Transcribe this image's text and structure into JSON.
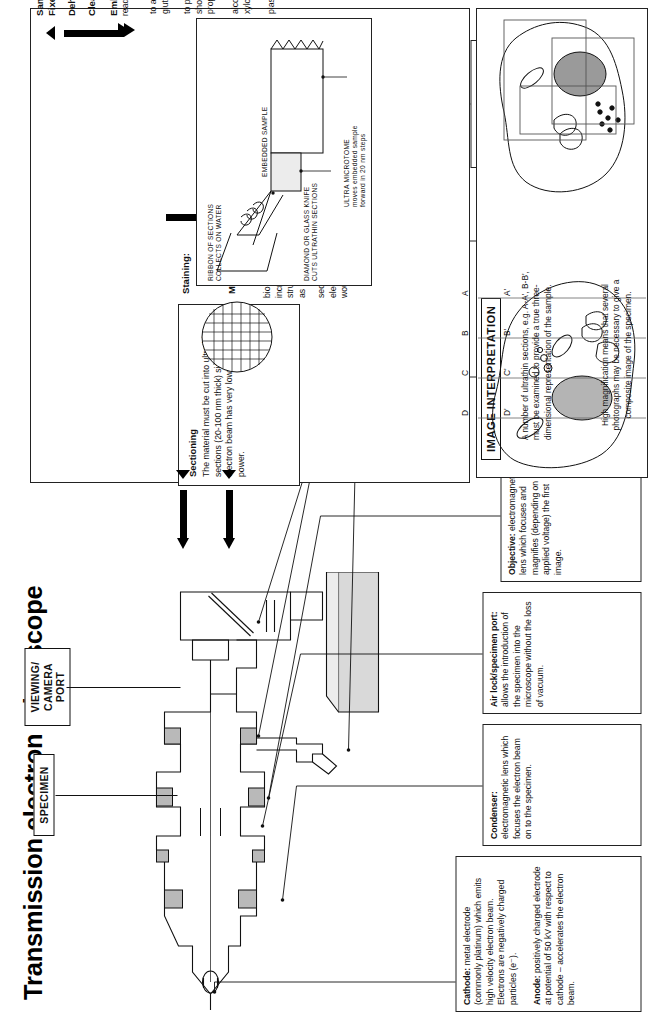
{
  "title": "Transmission electron microscope",
  "preparation": {
    "steps": [
      {
        "label": "Sample is",
        "sub": "Fixed:"
      },
      {
        "label": "Dehydrated:",
        "sub": ""
      },
      {
        "label": "Cleared:",
        "sub": ""
      },
      {
        "label": "Embedded:",
        "sub": "ready for"
      }
    ],
    "paragraphs": [
      "to avoid deformation of all cell components. Use small sample (rapid penetration) and immerse in glutaraldehyde or glutaraldehyde/osmic acid.",
      "to prepare material for infiltration by embedding or infiltration medium which is not miscible with water. Dehydration should be gradual to preserve fine detail, using a series of progressively increasing concentrations of ethanol or propanone.",
      "alcohol or propanone may be immiscible with embedding agents and so is replaced with a clearing agent (commonly xylol ) which is miscible and also makes the material transparent.",
      "plastic or resin  is used to support the material so that it is not distorted during sectioning."
    ],
    "italic_terms": [
      "glutaraldehyde",
      "glutaraldehyde/osmic acid",
      "ethanol",
      "propanone",
      "xylol",
      "plastic or resin"
    ]
  },
  "sectioning": {
    "heading": "Sectioning",
    "body": "The material must be cut into ultrathin sections (20-100 nm thick) since the electron beam has very low penetrating power.",
    "italic": "ultrathin sections"
  },
  "staining": {
    "label": "Staining:",
    "body": "biological structures are transparent, or nearly so, to electrons. To increase electron beam deflection (i.e. contrast between different structures) sections are treated with solutions of heavy metal salts such as uranyl or lead acetate.",
    "italic": "solutions of heavy metal salts"
  },
  "mounting": {
    "label": "Mounting:",
    "body": "sections are supported on a small copper grid (~3 mm diameter). The electron beam may pass through the gaps in the grid (a glass slide would not permit transmission of electron beam."
  },
  "microtome_inset": {
    "captions": [
      "EMBEDDED SAMPLE",
      "ULTRA MICROTOME",
      "moves embedded sample",
      "forward in 20 nm steps",
      "RIBBON OF SECTIONS",
      "COLLECTS ON WATER",
      "DIAMOND OR GLASS KNIFE",
      "CUTS ULTRATHIN SECTIONS"
    ]
  },
  "interpretation": {
    "heading": "IMAGE INTERPRETATION",
    "plane_labels": [
      "A",
      "B",
      "C",
      "D"
    ],
    "plane_labels_primed": [
      "A'",
      "B'",
      "C'",
      "D'"
    ],
    "note_left": "A number of ultrathin sections, e.g. A-A', B-B', must be examined to provide a true three-dimensional representation of the sample.",
    "note_right": "High magnification means that several photographs may be necessary to give a composite image of the specimen."
  },
  "machine_labels": {
    "specimen": "SPECIMEN",
    "viewing": "VIEWING/\nCAMERA\nPORT"
  },
  "callouts": [
    {
      "id": "cathode",
      "head": "Cathode:",
      "body": "metal electrode (commonly platinum) which emits high velocity electron beam. Electrons are negatively charged particles (e⁻)."
    },
    {
      "id": "anode",
      "head": "Anode:",
      "body": "positively charged electrode at potential of 50 kV with respect to cathode – accelerates the electron beam."
    },
    {
      "id": "condenser",
      "head": "Condenser:",
      "body": "electromagnetic lens which focuses the electron beam on to the specimen."
    },
    {
      "id": "airlock",
      "head": "Air lock/specimen port:",
      "body": "allows the introduction of the specimen into the microscope without the loss of vacuum."
    },
    {
      "id": "objective",
      "head": "Objective:",
      "body": "electromagnetic lens which focuses and magnifies (depending on applied voltage) the first image."
    },
    {
      "id": "projector",
      "head": "Projector:",
      "body": "further magnification by selection of region of image to be viewed."
    },
    {
      "id": "vacuum",
      "head": "To vacuum pump:",
      "body": "creation of vacuum to minimize electron scattering and any heating due to electron/air molecule collision."
    },
    {
      "id": "screen",
      "head": "Fluorescent, swing out, screen:",
      "body": "coated with electron sensitive compounds - necessary since deflected electron beam (the image) cannot be viewed directly."
    },
    {
      "id": "plate",
      "head": "Photographic plate:",
      "body": "allows a black and white permanent record of the image to be made. Printing may offer further magnification."
    },
    {
      "id": "base",
      "head": "Concrete base:",
      "body": "stable support which minimizes vibration and thus eliminates unwanted deflection of electron beam."
    }
  ],
  "colors": {
    "ink": "#111111",
    "paper": "#ffffff",
    "grey_fill": "#c9c9c9",
    "light_grey": "#e9e9e9"
  }
}
